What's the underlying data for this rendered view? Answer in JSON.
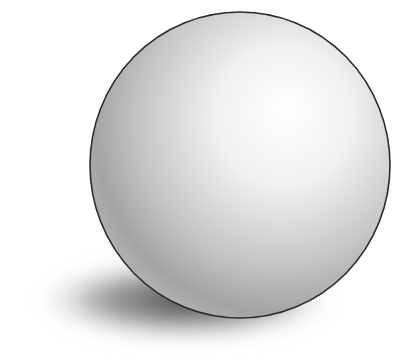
{
  "scene": {
    "subject": "shaded sphere with cast shadow",
    "background_color": "#ffffff",
    "sphere": {
      "cx": 240,
      "cy": 165,
      "rx": 150,
      "ry": 153,
      "outline_color": "#2a2a2a",
      "highlight_color": "#ffffff",
      "core_shadow_color": "#8f8f8f"
    },
    "shadow": {
      "color": "#4a4a4a"
    }
  }
}
